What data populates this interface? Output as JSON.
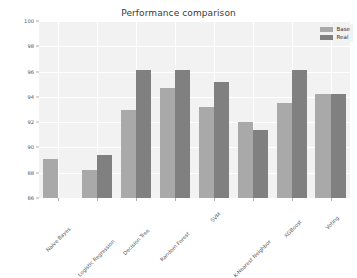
{
  "chart_data": {
    "type": "bar",
    "title": "Performance comparison",
    "xlabel": "",
    "ylabel": "",
    "ylim": [
      86,
      100
    ],
    "yticks": [
      86,
      88,
      90,
      92,
      94,
      96,
      98,
      100
    ],
    "grid": true,
    "legend_position": "upper right",
    "categories": [
      "Naive Bayes",
      "Logistic Regression",
      "Decision Tree",
      "Random Forest",
      "SVM",
      "K-Nearest Neighbor",
      "XGBoost",
      "Voting"
    ],
    "series": [
      {
        "name": "Base",
        "color": "#a9a9a9",
        "values": [
          89.1,
          88.2,
          93.0,
          94.7,
          93.2,
          92.05,
          93.5,
          94.2
        ]
      },
      {
        "name": "Real",
        "color": "#808080",
        "values": [
          85.6,
          89.4,
          96.15,
          96.15,
          95.2,
          91.35,
          96.15,
          94.2
        ]
      }
    ]
  },
  "figure": {
    "background_color": "#ffffff",
    "axes_background_color": "#f2f2f2",
    "grid_color": "#ffffff",
    "tick_label_color": "#5a5a5a"
  }
}
